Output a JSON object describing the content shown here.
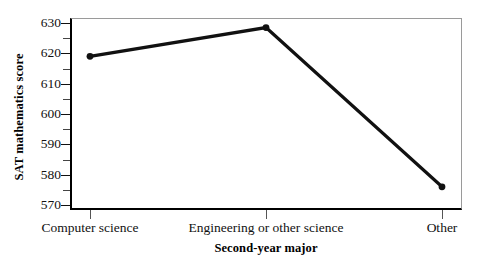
{
  "chart_data": {
    "type": "line",
    "title": "",
    "xlabel": "Second-year major",
    "ylabel": "SAT mathematics score",
    "categories": [
      "Computer science",
      "Engineering or other science",
      "Other"
    ],
    "values": [
      619,
      628.5,
      576
    ],
    "series": [
      {
        "name": "SAT mathematics score",
        "values": [
          619,
          628.5,
          576
        ]
      }
    ],
    "ylim": [
      567,
      631
    ],
    "ytick_labels": [
      "630",
      "620",
      "610",
      "600",
      "590",
      "580",
      "570"
    ],
    "ytick_values": [
      630,
      620,
      610,
      600,
      590,
      580,
      570
    ],
    "yminor_values": [
      625,
      615,
      605,
      595,
      585,
      575
    ],
    "grid": false,
    "legend": null,
    "legend_position": "none",
    "marker": "circle",
    "line_color": "#111111",
    "marker_color": "#111111",
    "axis_color": "#000000",
    "frame_color": "#9a9a9a",
    "background": "#ffffff"
  },
  "axes": {
    "y_title": "SAT mathematics score",
    "x_title": "Second-year major"
  }
}
